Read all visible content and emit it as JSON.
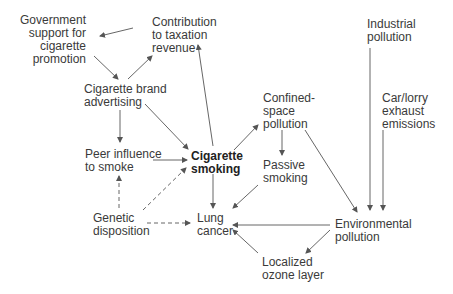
{
  "nodes": {
    "government": "Government\nsupport for\ncigarette\npromotion",
    "taxation": "Contribution\nto taxation\nrevenue",
    "advertising": "Cigarette brand\nadvertising",
    "peer": "Peer influence\nto smoke",
    "smoking": "Cigarette\nsmoking",
    "genetic": "Genetic\ndisposition",
    "lung": "Lung\ncancer",
    "confined": "Confined-\nspace\npollution",
    "passive": "Passive\nsmoking",
    "industrial": "Industrial\npollution",
    "car": "Car/lorry\nexhaust\nemissions",
    "environmental": "Environmental\npollution",
    "ozone": "Localized\nozone layer"
  },
  "edges": [
    {
      "from": "taxation",
      "to": "government",
      "style": "solid"
    },
    {
      "from": "government",
      "to": "advertising",
      "style": "solid"
    },
    {
      "from": "advertising",
      "to": "taxation",
      "style": "solid"
    },
    {
      "from": "advertising",
      "to": "peer",
      "style": "solid"
    },
    {
      "from": "advertising",
      "to": "smoking",
      "style": "solid"
    },
    {
      "from": "smoking",
      "to": "taxation",
      "style": "solid"
    },
    {
      "from": "peer",
      "to": "smoking",
      "style": "solid"
    },
    {
      "from": "smoking",
      "to": "confined",
      "style": "solid"
    },
    {
      "from": "smoking",
      "to": "lung",
      "style": "solid"
    },
    {
      "from": "genetic",
      "to": "peer",
      "style": "dashed"
    },
    {
      "from": "genetic",
      "to": "smoking",
      "style": "dashed"
    },
    {
      "from": "genetic",
      "to": "lung",
      "style": "dashed"
    },
    {
      "from": "confined",
      "to": "passive",
      "style": "solid"
    },
    {
      "from": "confined",
      "to": "environmental",
      "style": "solid"
    },
    {
      "from": "passive",
      "to": "lung",
      "style": "solid"
    },
    {
      "from": "industrial",
      "to": "environmental",
      "style": "solid"
    },
    {
      "from": "car",
      "to": "environmental",
      "style": "solid"
    },
    {
      "from": "environmental",
      "to": "lung",
      "style": "solid"
    },
    {
      "from": "environmental",
      "to": "ozone",
      "style": "solid"
    },
    {
      "from": "ozone",
      "to": "lung",
      "style": "solid"
    }
  ],
  "colors": {
    "line": "#555555",
    "text": "#3a3a3a"
  }
}
